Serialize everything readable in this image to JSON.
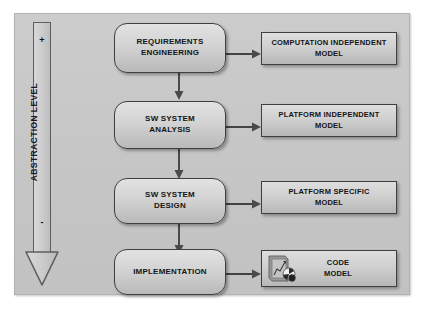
{
  "diagram": {
    "panel_color": "#c6c6c6",
    "box_border_color": "#3f3f3f",
    "axis": {
      "label": "ABSTRACTION LEVEL",
      "top_sign": "+",
      "bottom_sign": "-",
      "direction": "down"
    },
    "process_steps": [
      {
        "line1": "REQUIREMENTS",
        "line2": "ENGINEERING"
      },
      {
        "line1": "SW SYSTEM",
        "line2": "ANALYSIS"
      },
      {
        "line1": "SW SYSTEM",
        "line2": "DESIGN"
      },
      {
        "line1": "IMPLEMENTATION",
        "line2": ""
      }
    ],
    "models": [
      {
        "line1": "COMPUTATION INDEPENDENT",
        "line2": "MODEL",
        "icon": ""
      },
      {
        "line1": "PLATFORM INDEPENDENT",
        "line2": "MODEL",
        "icon": ""
      },
      {
        "line1": "PLATFORM SPECIFIC",
        "line2": "MODEL",
        "icon": ""
      },
      {
        "line1": "CODE",
        "line2": "MODEL",
        "icon": "image-thumbnail-icon"
      }
    ]
  }
}
